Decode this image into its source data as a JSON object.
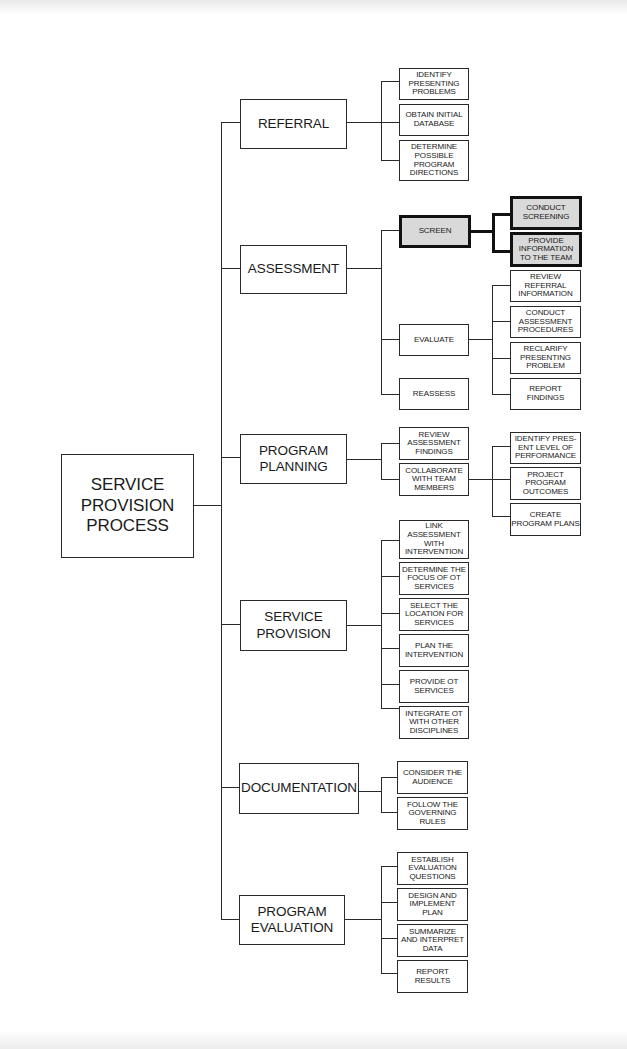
{
  "diagram": {
    "title": "SERVICE PROVISION PROCESS",
    "root": {
      "label": "SERVICE\nPROVISION\nPROCESS"
    },
    "phases": [
      {
        "label": "REFERRAL",
        "steps": [
          {
            "label": "IDENTIFY\nPRESENTING\nPROBLEMS"
          },
          {
            "label": "OBTAIN INITIAL\nDATABASE"
          },
          {
            "label": "DETERMINE\nPOSSIBLE\nPROGRAM\nDIRECTIONS"
          }
        ]
      },
      {
        "label": "ASSESSMENT",
        "steps": [
          {
            "label": "SCREEN",
            "highlighted": true,
            "substeps": [
              {
                "label": "CONDUCT\nSCREENING",
                "highlighted": true
              },
              {
                "label": "PROVIDE\nINFORMATION\nTO THE TEAM",
                "highlighted": true
              }
            ]
          },
          {
            "label": "EVALUATE",
            "substeps": [
              {
                "label": "REVIEW\nREFERRAL\nINFORMATION"
              },
              {
                "label": "CONDUCT\nASSESSMENT\nPROCEDURES"
              },
              {
                "label": "RECLARIFY\nPRESENTING\nPROBLEM"
              },
              {
                "label": "REPORT\nFINDINGS"
              }
            ]
          },
          {
            "label": "REASSESS"
          }
        ]
      },
      {
        "label": "PROGRAM\nPLANNING",
        "steps": [
          {
            "label": "REVIEW\nASSESSMENT\nFINDINGS"
          },
          {
            "label": "COLLABORATE\nWITH TEAM\nMEMBERS",
            "substeps": [
              {
                "label": "IDENTIFY  PRES-\nENT LEVEL OF\nPERFORMANCE"
              },
              {
                "label": "PROJECT\nPROGRAM\nOUTCOMES"
              },
              {
                "label": "CREATE\nPROGRAM PLANS"
              }
            ]
          }
        ]
      },
      {
        "label": "SERVICE\nPROVISION",
        "steps": [
          {
            "label": "LINK\nASSESSMENT\nWITH\nINTERVENTION"
          },
          {
            "label": "DETERMINE THE\nFOCUS OF OT\nSERVICES"
          },
          {
            "label": "SELECT THE\nLOCATION FOR\nSERVICES"
          },
          {
            "label": "PLAN THE\nINTERVENTION"
          },
          {
            "label": "PROVIDE OT\nSERVICES"
          },
          {
            "label": "INTEGRATE OT\nWITH OTHER\nDISCIPLINES"
          }
        ]
      },
      {
        "label": "DOCUMENTATION",
        "steps": [
          {
            "label": "CONSIDER THE\nAUDIENCE"
          },
          {
            "label": "FOLLOW THE\nGOVERNING\nRULES"
          }
        ]
      },
      {
        "label": "PROGRAM\nEVALUATION",
        "steps": [
          {
            "label": "ESTABLISH\nEVALUATION\nQUESTIONS"
          },
          {
            "label": "DESIGN AND\nIMPLEMENT\nPLAN"
          },
          {
            "label": "SUMMARIZE\nAND INTERPRET\nDATA"
          },
          {
            "label": "REPORT\nRESULTS"
          }
        ]
      }
    ],
    "colors": {
      "line": "#2a2a2a",
      "highlight_fill": "#d9d9d9",
      "highlight_border": "#111111",
      "background": "#ffffff"
    }
  }
}
